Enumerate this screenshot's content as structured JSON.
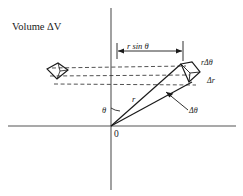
{
  "figure": {
    "title": "Volume ΔV",
    "labels": {
      "horizontal_extent": "r sin θ",
      "arc_length": "rΔθ",
      "radial_thickness": "Δr",
      "angle_increment": "Δθ",
      "radius": "r",
      "polar_angle": "θ",
      "origin": "0"
    },
    "colors": {
      "axis": "#555555",
      "line": "#1a1a1a",
      "dashed": "#333333",
      "background": "#ffffff"
    }
  }
}
